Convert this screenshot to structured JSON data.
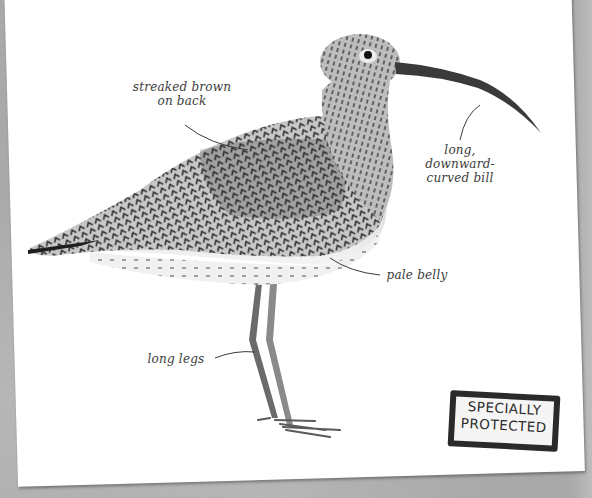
{
  "page": {
    "colors": {
      "background": "#a9a9a9",
      "card": "#ffffff",
      "annotation_text": "#3b3b3b",
      "stamp_ink": "#2a2a2a"
    }
  },
  "annotations": [
    {
      "id": "back",
      "lines": [
        "streaked brown",
        "on back"
      ]
    },
    {
      "id": "bill",
      "lines": [
        "long,",
        "downward-",
        "curved bill"
      ]
    },
    {
      "id": "belly",
      "lines": [
        "pale belly"
      ]
    },
    {
      "id": "legs",
      "lines": [
        "long legs"
      ]
    }
  ],
  "stamp": {
    "line1": "SPECIALLY",
    "line2": "PROTECTED"
  }
}
